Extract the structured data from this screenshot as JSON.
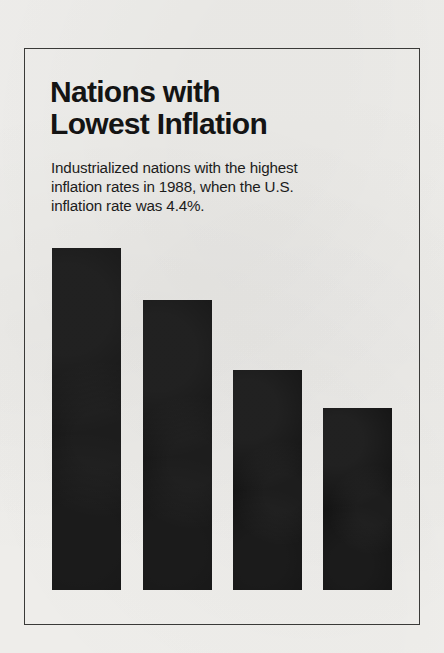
{
  "headline": {
    "title": "Nations with\nLowest Inflation",
    "subtitle": "Industrialized nations with the highest\ninflation rates in 1988, when the U.S.\ninflation rate was 4.4%."
  },
  "colors": {
    "ink": "#141414",
    "paper": "#f4f3f0",
    "frame": "#3a3a38",
    "label": "#ffffff"
  },
  "chart_data": {
    "type": "bar",
    "title": "Nations with Lowest Inflation",
    "subtitle": "Industrialized nations with the highest inflation rates in 1988, when the U.S. inflation rate was 4.4%.",
    "xlabel": "",
    "ylabel": "Inflation rate (%)",
    "ylim": [
      0,
      2.2
    ],
    "grid": false,
    "legend": null,
    "orientation": "vertical",
    "value_suffix": "%",
    "categories": [
      "Australia, Luxembourg, Belgium and Switzerland",
      "West Germany",
      "The Netherlands",
      "Japan"
    ],
    "values": [
      1.9,
      1.6,
      1.2,
      1.0
    ],
    "value_labels": [
      "1.9%",
      "1.6%",
      "1.2%",
      "1.0%"
    ],
    "reference": {
      "label": "U.S. inflation rate 1988",
      "value": 4.4,
      "value_label": "4.4%"
    },
    "year": 1988,
    "bars": [
      {
        "pct": "1.9%",
        "name": "Australia, Luxembourg,\nBelgium and Switzerland",
        "name_flat": "Australia, Luxembourg, Belgium and Switzerland",
        "value": 1.9,
        "two_line": true,
        "x": 52,
        "y": 248,
        "w": 69,
        "h": 342
      },
      {
        "pct": "1.6%",
        "name": "West Germany",
        "name_flat": "West Germany",
        "value": 1.6,
        "two_line": false,
        "x": 143,
        "y": 300,
        "w": 69,
        "h": 290
      },
      {
        "pct": "1.2%",
        "name": "The Netherlands",
        "name_flat": "The Netherlands",
        "value": 1.2,
        "two_line": false,
        "x": 233,
        "y": 370,
        "w": 69,
        "h": 220
      },
      {
        "pct": "1.0%",
        "name": "Japan",
        "name_flat": "Japan",
        "value": 1.0,
        "two_line": false,
        "x": 323,
        "y": 408,
        "w": 69,
        "h": 182
      }
    ]
  }
}
